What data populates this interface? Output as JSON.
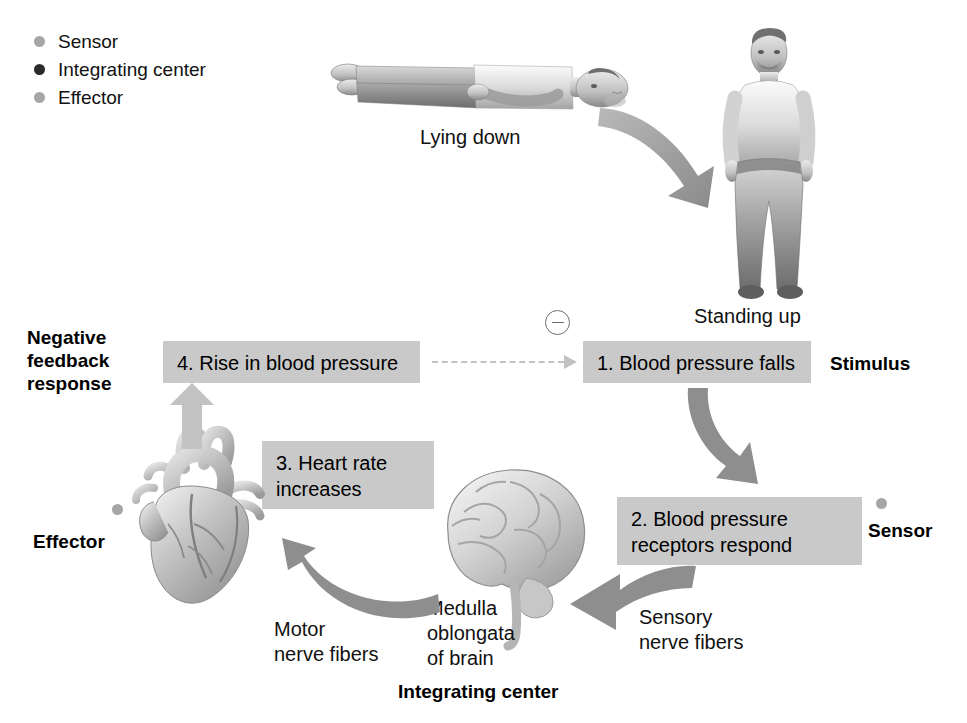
{
  "figure": {
    "title_present": false,
    "type": "physiology-negative-feedback-loop",
    "background_color": "#ffffff",
    "box_fill": "#c9c9c9",
    "arrow_fill": "#8c8c8c",
    "dashed_arrow_color": "#c2c2c2"
  },
  "legend": {
    "items": [
      {
        "label": "Sensor",
        "color": "#a6a6a6",
        "marker": "sensor-dot"
      },
      {
        "label": "Integrating center",
        "color": "#2b2b2b",
        "marker": "integrating-center-dot"
      },
      {
        "label": "Effector",
        "color": "#a6a6a6",
        "marker": "effector-dot"
      }
    ]
  },
  "body_states": {
    "lying_down": "Lying down",
    "standing_up": "Standing up"
  },
  "feedback_sign": "−",
  "steps": [
    {
      "number": "1",
      "text": "1. Blood pressure falls",
      "role_label": "Stimulus"
    },
    {
      "number": "2",
      "text": "2. Blood pressure\n    receptors respond",
      "role_label": "Sensor"
    },
    {
      "number": "3",
      "text": "3. Heart rate\n    increases",
      "role_label": ""
    },
    {
      "number": "4",
      "text": "4. Rise in blood pressure",
      "role_label": ""
    }
  ],
  "role_labels": {
    "stimulus": "Stimulus",
    "sensor": "Sensor",
    "effector": "Effector",
    "integrating_center": "Integrating center",
    "negative_feedback_response": "Negative\nfeedback\nresponse"
  },
  "anatomy_labels": {
    "motor_nerve_fibers": "Motor\nnerve fibers",
    "sensory_nerve_fibers": "Sensory\nnerve fibers",
    "medulla": "Medulla\noblongata\nof brain"
  },
  "images": {
    "lying_person": "person-lying-down-photo",
    "standing_person": "person-standing-up-photo",
    "heart": "heart-illustration",
    "brain": "brain-illustration"
  }
}
